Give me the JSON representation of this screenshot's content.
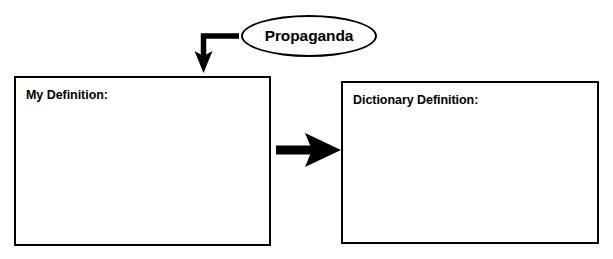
{
  "worksheet": {
    "type": "vocabulary-graphic-organizer",
    "background_color": "#ffffff",
    "line_color": "#000000"
  },
  "topic": {
    "label": "Propaganda",
    "shape": "ellipse"
  },
  "boxes": [
    {
      "id": "my-definition",
      "label": "My Definition:",
      "content": ""
    },
    {
      "id": "dictionary-definition",
      "label": "Dictionary Definition:",
      "content": ""
    }
  ],
  "arrows": [
    {
      "id": "topic-to-my-definition",
      "name": "elbow-arrow-down",
      "direction": "down",
      "from": "topic",
      "to": "my-definition"
    },
    {
      "id": "my-definition-to-dictionary-definition",
      "name": "arrow-right",
      "direction": "right",
      "from": "my-definition",
      "to": "dictionary-definition"
    }
  ]
}
